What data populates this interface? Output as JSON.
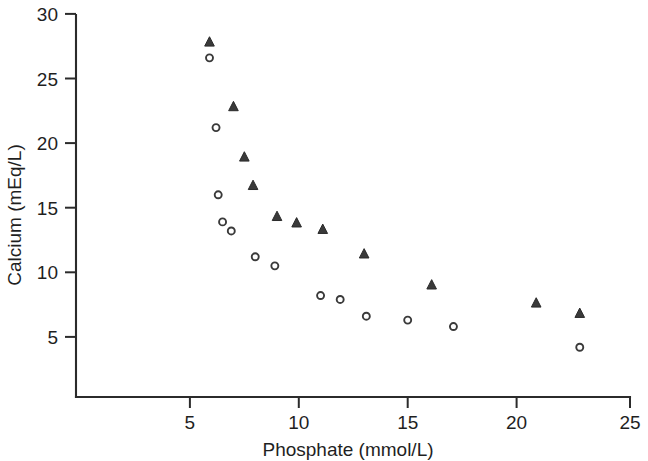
{
  "chart_data": {
    "type": "scatter",
    "title": "",
    "xlabel": "Phosphate (mmol/L)",
    "ylabel": "Calcium (mEq/L)",
    "xlim": [
      0,
      25
    ],
    "ylim": [
      0,
      30
    ],
    "xticks": [
      5,
      10,
      15,
      20,
      25
    ],
    "xtick_labels": [
      "5",
      "10",
      "15",
      "20",
      "25"
    ],
    "yticks": [
      5,
      10,
      15,
      20,
      25,
      30
    ],
    "ytick_labels": [
      "5",
      "10",
      "15",
      "20",
      "25",
      "30"
    ],
    "grid": false,
    "legend": "none",
    "series": [
      {
        "name": "triangle-series",
        "marker": "triangle",
        "color": "#3a3a3a",
        "points": [
          {
            "x": 5.9,
            "y": 27.8
          },
          {
            "x": 7.0,
            "y": 22.8
          },
          {
            "x": 7.5,
            "y": 18.9
          },
          {
            "x": 7.9,
            "y": 16.7
          },
          {
            "x": 9.0,
            "y": 14.3
          },
          {
            "x": 9.9,
            "y": 13.8
          },
          {
            "x": 11.1,
            "y": 13.3
          },
          {
            "x": 13.0,
            "y": 11.4
          },
          {
            "x": 16.1,
            "y": 9.0
          },
          {
            "x": 20.9,
            "y": 7.6
          },
          {
            "x": 22.9,
            "y": 6.8
          }
        ]
      },
      {
        "name": "circle-series",
        "marker": "circle",
        "color": "#3a3a3a",
        "points": [
          {
            "x": 5.9,
            "y": 26.6
          },
          {
            "x": 6.2,
            "y": 21.2
          },
          {
            "x": 6.3,
            "y": 16.0
          },
          {
            "x": 6.5,
            "y": 13.9
          },
          {
            "x": 6.9,
            "y": 13.2
          },
          {
            "x": 8.0,
            "y": 11.2
          },
          {
            "x": 8.9,
            "y": 10.5
          },
          {
            "x": 11.0,
            "y": 8.2
          },
          {
            "x": 11.9,
            "y": 7.9
          },
          {
            "x": 13.1,
            "y": 6.6
          },
          {
            "x": 15.0,
            "y": 6.3
          },
          {
            "x": 17.1,
            "y": 5.8
          },
          {
            "x": 22.9,
            "y": 4.2
          }
        ]
      }
    ]
  },
  "figure": {
    "background_color": "#ffffff",
    "axis_color": "#2b2b2b",
    "marker_color": "#3a3a3a"
  }
}
